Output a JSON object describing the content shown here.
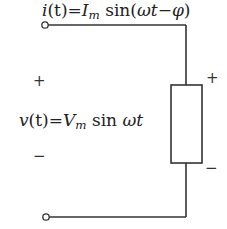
{
  "diagram": {
    "type": "circuit",
    "current_label": {
      "lhs_symbol": "i",
      "lhs_arg": "(t)",
      "equals": "=",
      "amp_symbol": "I",
      "amp_sub": "m",
      "func": " sin",
      "arg_open": "(",
      "omega": "ω",
      "t": "t",
      "minus": "−",
      "phi": "φ",
      "arg_close": ")"
    },
    "voltage_label": {
      "lhs_symbol": "v",
      "lhs_arg": "(t)",
      "equals": "=",
      "amp_symbol": "V",
      "amp_sub": "m",
      "func": " sin ",
      "omega": "ω",
      "t": "t"
    },
    "source_polarity": {
      "plus": "+",
      "minus": "−"
    },
    "load_polarity": {
      "plus": "+",
      "minus": "−"
    },
    "components": [
      {
        "kind": "terminal",
        "position": "top-left"
      },
      {
        "kind": "terminal",
        "position": "bottom-left"
      },
      {
        "kind": "resistor",
        "position": "right-branch"
      }
    ],
    "colors": {
      "wire": "#333333",
      "text": "#222222",
      "background": "#ffffff"
    }
  }
}
